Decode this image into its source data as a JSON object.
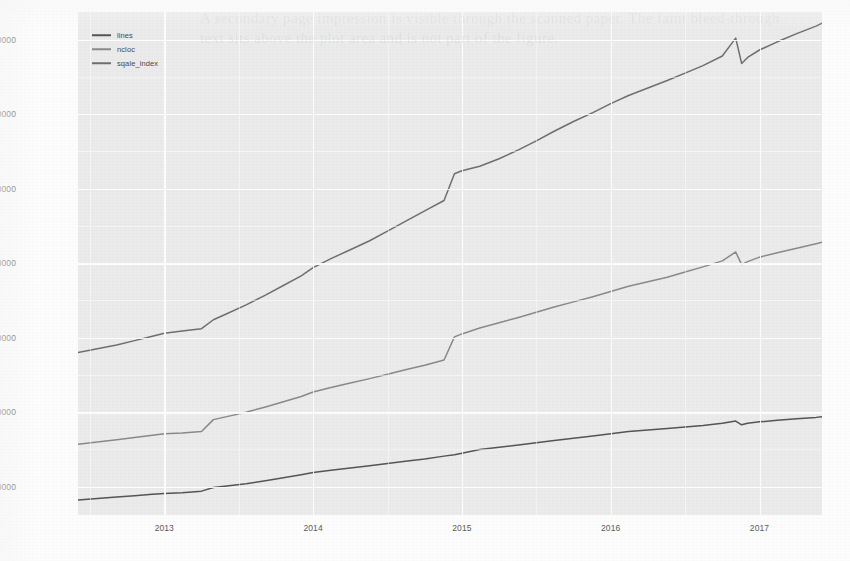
{
  "page": {
    "ghost_text": "A secondary page impression is visible through the scanned paper. The faint bleed-through text sits above the plot area and is not part of the figure."
  },
  "legend": {
    "position": "top-left-inside",
    "entries": [
      {
        "label": "lines",
        "color": "#555555"
      },
      {
        "label": "ncloc",
        "color": "#8a8a8a"
      },
      {
        "label": "sqale_index",
        "color": "#6f6f6f"
      }
    ]
  },
  "axes": {
    "y_ticks": [
      "100000",
      "200000",
      "300000",
      "400000",
      "500000",
      "600000",
      "700000"
    ],
    "x_ticks": [
      "2013",
      "2014",
      "2015",
      "2016",
      "2017"
    ]
  },
  "chart_data": {
    "type": "line",
    "title": "",
    "subtitle": "",
    "xlabel": "",
    "ylabel": "",
    "grid": true,
    "legend_position": "top-left",
    "xlim": [
      2012.42,
      2017.42
    ],
    "ylim": [
      62000,
      737000
    ],
    "x_tick_values": [
      2013,
      2014,
      2015,
      2016,
      2017
    ],
    "y_tick_values": [
      100000,
      200000,
      300000,
      400000,
      500000,
      600000,
      700000
    ],
    "x": [
      2012.42,
      2012.55,
      2012.68,
      2012.8,
      2012.92,
      2013.0,
      2013.12,
      2013.25,
      2013.33,
      2013.42,
      2013.55,
      2013.68,
      2013.8,
      2013.92,
      2014.0,
      2014.12,
      2014.25,
      2014.38,
      2014.5,
      2014.62,
      2014.75,
      2014.88,
      2014.95,
      2015.0,
      2015.12,
      2015.25,
      2015.38,
      2015.5,
      2015.62,
      2015.75,
      2015.88,
      2016.0,
      2016.12,
      2016.25,
      2016.38,
      2016.5,
      2016.62,
      2016.75,
      2016.84,
      2016.88,
      2016.92,
      2017.0,
      2017.12,
      2017.25,
      2017.38,
      2017.42
    ],
    "series": [
      {
        "name": "lines",
        "color": "#555555",
        "values": [
          82000,
          84000,
          86000,
          88000,
          90000,
          91000,
          92000,
          94000,
          99000,
          101000,
          104000,
          108000,
          112000,
          116000,
          119000,
          122000,
          125000,
          128000,
          131000,
          134000,
          137000,
          141000,
          143000,
          145000,
          150000,
          153000,
          156000,
          159000,
          162000,
          165000,
          168000,
          171000,
          174000,
          176000,
          178000,
          180000,
          182000,
          185000,
          188000,
          183000,
          185000,
          187000,
          189000,
          191000,
          193000,
          194000
        ]
      },
      {
        "name": "ncloc",
        "color": "#8a8a8a",
        "values": [
          157000,
          160000,
          163000,
          166000,
          169000,
          171000,
          172000,
          174000,
          190000,
          194000,
          200000,
          207000,
          214000,
          221000,
          227000,
          233000,
          239000,
          245000,
          251000,
          257000,
          263000,
          270000,
          301000,
          305000,
          313000,
          320000,
          327000,
          334000,
          341000,
          348000,
          355000,
          362000,
          369000,
          375000,
          381000,
          388000,
          395000,
          403000,
          415000,
          398000,
          402000,
          408000,
          414000,
          420000,
          426000,
          428000
        ]
      },
      {
        "name": "sqale_index",
        "color": "#6f6f6f",
        "values": [
          280000,
          285000,
          290000,
          296000,
          302000,
          306000,
          309000,
          312000,
          324000,
          332000,
          344000,
          357000,
          370000,
          383000,
          394000,
          406000,
          418000,
          430000,
          443000,
          456000,
          470000,
          484000,
          520000,
          524000,
          530000,
          540000,
          552000,
          564000,
          577000,
          590000,
          602000,
          614000,
          625000,
          635000,
          645000,
          655000,
          665000,
          678000,
          702000,
          668000,
          676000,
          686000,
          697000,
          708000,
          718000,
          722000
        ]
      }
    ],
    "notes": [
      "Sharp step increase in all three series around 2013.3",
      "Large jump in ncloc and sqale_index around 2014.95",
      "Sharp drop then recovery in all series around 2016.85-2016.92"
    ]
  }
}
